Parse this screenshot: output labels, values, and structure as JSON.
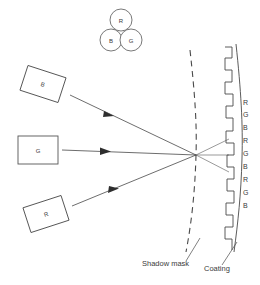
{
  "figure": {
    "background_color": "#ffffff",
    "line_color": "#4a4a4a",
    "text_color": "#3a3a3a"
  },
  "triad": {
    "name": "phosphor-dot-triad",
    "dots": [
      {
        "label": "R",
        "cx": 121,
        "cy": 20,
        "r": 11
      },
      {
        "label": "B",
        "cx": 111,
        "cy": 40,
        "r": 11
      },
      {
        "label": "G",
        "cx": 131,
        "cy": 40,
        "r": 11
      }
    ]
  },
  "guns": [
    {
      "label": "B",
      "name": "electron-gun-blue",
      "cx": 43,
      "cy": 84,
      "w": 40,
      "h": 26,
      "rotation": 18
    },
    {
      "label": "G",
      "name": "electron-gun-green",
      "cx": 38,
      "cy": 150,
      "w": 40,
      "h": 28,
      "rotation": 0
    },
    {
      "label": "R",
      "name": "electron-gun-red",
      "cx": 46,
      "cy": 214,
      "w": 40,
      "h": 26,
      "rotation": -18
    }
  ],
  "beams": [
    {
      "name": "beam-blue",
      "from": [
        70,
        95
      ],
      "to": [
        196,
        155
      ],
      "arrow_at": 0.42
    },
    {
      "name": "beam-green",
      "from": [
        62,
        150
      ],
      "to": [
        196,
        155
      ],
      "arrow_at": 0.3
    },
    {
      "name": "beam-red",
      "from": [
        72,
        206
      ],
      "to": [
        196,
        155
      ],
      "arrow_at": 0.42
    }
  ],
  "converged_beams": [
    {
      "name": "beam-spread-upper",
      "from": [
        196,
        155
      ],
      "to": [
        228,
        140
      ]
    },
    {
      "name": "beam-spread-middle",
      "from": [
        196,
        155
      ],
      "to": [
        228,
        155
      ]
    },
    {
      "name": "beam-spread-lower",
      "from": [
        196,
        155
      ],
      "to": [
        228,
        172
      ]
    }
  ],
  "shadow_mask": {
    "name": "shadow-mask",
    "label": "Shadow mask",
    "style": "dashed",
    "label_x": 142,
    "label_y": 266,
    "leader": {
      "from": [
        185,
        262
      ],
      "to": [
        199,
        238
      ]
    }
  },
  "coating": {
    "name": "phosphor-coating",
    "label": "Coating",
    "style": "stepped",
    "label_x": 204,
    "label_y": 270,
    "leader": {
      "from": [
        222,
        266
      ],
      "to": [
        238,
        243
      ]
    }
  },
  "phosphor_strips": {
    "name": "phosphor-strip-labels",
    "labels": [
      "R",
      "G",
      "B",
      "R",
      "G",
      "B",
      "R",
      "G",
      "B"
    ],
    "x": 243,
    "start_y": 102,
    "spacing": 12.5
  }
}
